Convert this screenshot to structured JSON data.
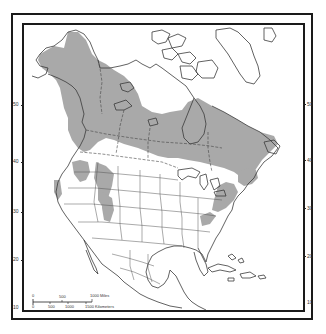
{
  "map": {
    "subject": "North America range map",
    "range_fill_color": "#a9a9a9",
    "line_color": "#3a3a3a",
    "background_color": "#ffffff"
  },
  "latitude_labels_left": [
    {
      "value": "50",
      "y": 103
    },
    {
      "value": "40",
      "y": 160
    },
    {
      "value": "30",
      "y": 210
    },
    {
      "value": "20",
      "y": 258
    },
    {
      "value": "10",
      "y": 306
    }
  ],
  "latitude_labels_right": [
    {
      "value": "50",
      "y": 102
    },
    {
      "value": "40",
      "y": 158
    },
    {
      "value": "30",
      "y": 206
    },
    {
      "value": "20",
      "y": 254
    },
    {
      "value": "10",
      "y": 300
    }
  ],
  "scale_bar": {
    "miles_labels": [
      "0",
      "500",
      "1000 Miles"
    ],
    "km_labels": [
      "0",
      "500",
      "1000",
      "1500 Kilometers"
    ]
  }
}
